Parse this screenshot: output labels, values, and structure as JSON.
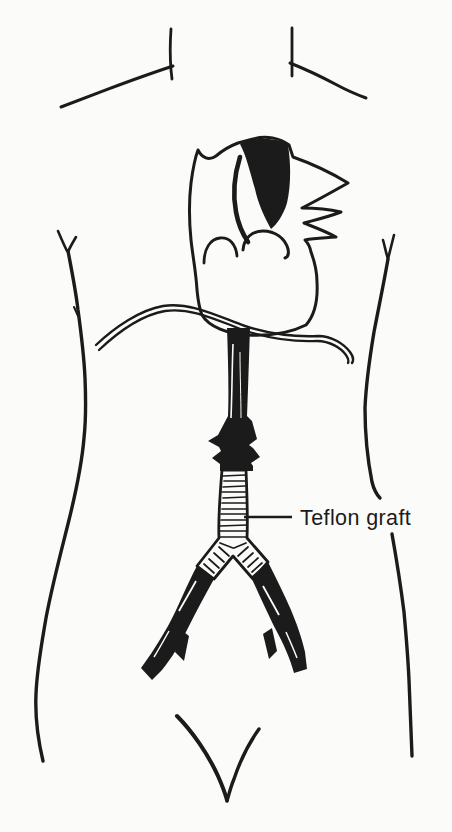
{
  "figure": {
    "label": "Teflon graft"
  },
  "colors": {
    "ink": "#1b1b1b",
    "heart_fill": "#c6c6c6",
    "graft_fill": "#fdfdfc",
    "paper": "#fbfbf9"
  }
}
